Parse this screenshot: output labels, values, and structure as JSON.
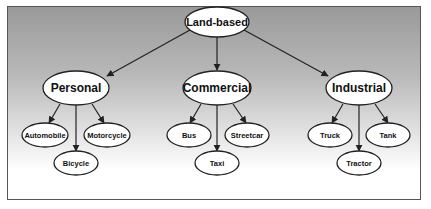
{
  "diagram": {
    "type": "tree",
    "root": {
      "id": "land",
      "label": "Land-based"
    },
    "categories": [
      {
        "id": "personal",
        "label": "Personal",
        "children": [
          "Automobile",
          "Motorcycle",
          "Bicycle"
        ]
      },
      {
        "id": "commercial",
        "label": "Commercial",
        "children": [
          "Bus",
          "Streetcar",
          "Taxi"
        ]
      },
      {
        "id": "industrial",
        "label": "Industrial",
        "children": [
          "Truck",
          "Tank",
          "Tractor"
        ]
      }
    ]
  },
  "nodes": {
    "land": "Land-based",
    "personal": "Personal",
    "commercial": "Commercial",
    "industrial": "Industrial",
    "automobile": "Automobile",
    "motorcycle": "Motorcycle",
    "bicycle": "Bicycle",
    "bus": "Bus",
    "streetcar": "Streetcar",
    "taxi": "Taxi",
    "truck": "Truck",
    "tank": "Tank",
    "tractor": "Tractor"
  },
  "colors": {
    "background_top": "#9a9a9a",
    "background_bottom": "#ffffff",
    "node_fill": "#ffffff",
    "stroke": "#222222"
  }
}
